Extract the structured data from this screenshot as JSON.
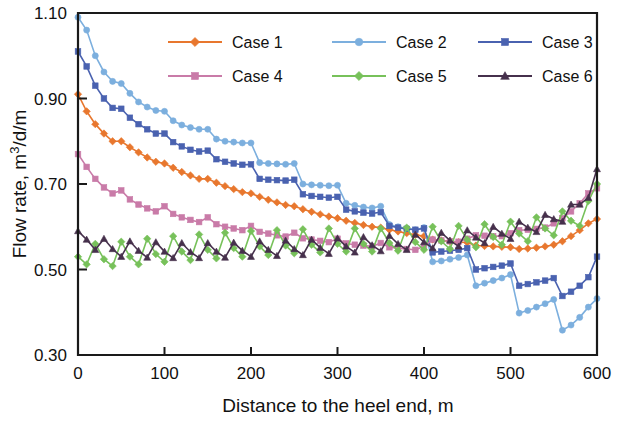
{
  "chart_data": {
    "type": "line",
    "title": "",
    "xlabel": "Distance to the heel end, m",
    "ylabel": "Flow rate, m³/d/m",
    "xlim": [
      0,
      600
    ],
    "ylim": [
      0.3,
      1.1
    ],
    "xticks": [
      0,
      100,
      200,
      300,
      400,
      500,
      600
    ],
    "yticks": [
      0.3,
      0.5,
      0.7,
      0.9,
      1.1
    ],
    "xtick_labels": [
      "0",
      "100",
      "200",
      "300",
      "400",
      "500",
      "600"
    ],
    "ytick_labels": [
      "0.30",
      "0.50",
      "0.70",
      "0.90",
      "1.10"
    ],
    "grid": false,
    "legend_position": "top-center-inside",
    "legend_columns": 3,
    "x": [
      0,
      10,
      20,
      30,
      40,
      50,
      60,
      70,
      80,
      90,
      100,
      110,
      120,
      130,
      140,
      150,
      160,
      170,
      180,
      190,
      200,
      210,
      220,
      230,
      240,
      250,
      260,
      270,
      280,
      290,
      300,
      310,
      320,
      330,
      340,
      350,
      360,
      370,
      380,
      390,
      400,
      410,
      420,
      430,
      440,
      450,
      460,
      470,
      480,
      490,
      500,
      510,
      520,
      530,
      540,
      550,
      560,
      570,
      580,
      590,
      600
    ],
    "series": [
      {
        "name": "Case 1",
        "color": "#E8772E",
        "marker": "diamond",
        "values": [
          0.91,
          0.87,
          0.84,
          0.818,
          0.8,
          0.8,
          0.786,
          0.774,
          0.762,
          0.752,
          0.748,
          0.738,
          0.728,
          0.72,
          0.712,
          0.712,
          0.703,
          0.695,
          0.688,
          0.681,
          0.678,
          0.67,
          0.663,
          0.657,
          0.651,
          0.648,
          0.641,
          0.635,
          0.629,
          0.624,
          0.62,
          0.614,
          0.609,
          0.604,
          0.6,
          0.598,
          0.593,
          0.589,
          0.585,
          0.581,
          0.578,
          0.57,
          0.568,
          0.566,
          0.564,
          0.563,
          0.556,
          0.555,
          0.554,
          0.553,
          0.552,
          0.548,
          0.549,
          0.551,
          0.554,
          0.558,
          0.566,
          0.578,
          0.592,
          0.608,
          0.618
        ]
      },
      {
        "name": "Case 2",
        "color": "#7CAFDE",
        "marker": "circle",
        "values": [
          1.09,
          1.06,
          1.0,
          0.962,
          0.94,
          0.935,
          0.912,
          0.892,
          0.88,
          0.872,
          0.87,
          0.848,
          0.838,
          0.832,
          0.828,
          0.828,
          0.805,
          0.8,
          0.798,
          0.796,
          0.796,
          0.75,
          0.748,
          0.747,
          0.746,
          0.748,
          0.7,
          0.698,
          0.697,
          0.696,
          0.697,
          0.655,
          0.65,
          0.646,
          0.644,
          0.648,
          0.605,
          0.6,
          0.596,
          0.593,
          0.598,
          0.518,
          0.52,
          0.524,
          0.528,
          0.534,
          0.462,
          0.468,
          0.474,
          0.48,
          0.488,
          0.398,
          0.404,
          0.412,
          0.42,
          0.43,
          0.358,
          0.37,
          0.388,
          0.412,
          0.432
        ]
      },
      {
        "name": "Case 3",
        "color": "#4A62B0",
        "marker": "square",
        "values": [
          1.01,
          0.975,
          0.93,
          0.9,
          0.878,
          0.876,
          0.855,
          0.84,
          0.828,
          0.818,
          0.818,
          0.798,
          0.788,
          0.78,
          0.776,
          0.778,
          0.758,
          0.752,
          0.748,
          0.745,
          0.746,
          0.712,
          0.71,
          0.709,
          0.708,
          0.71,
          0.676,
          0.672,
          0.67,
          0.668,
          0.67,
          0.64,
          0.636,
          0.633,
          0.631,
          0.634,
          0.602,
          0.598,
          0.595,
          0.593,
          0.596,
          0.54,
          0.542,
          0.544,
          0.546,
          0.55,
          0.5,
          0.503,
          0.506,
          0.509,
          0.514,
          0.462,
          0.466,
          0.47,
          0.474,
          0.48,
          0.438,
          0.448,
          0.462,
          0.482,
          0.53
        ]
      },
      {
        "name": "Case 4",
        "color": "#C97BA8",
        "marker": "square",
        "values": [
          0.77,
          0.74,
          0.712,
          0.692,
          0.678,
          0.685,
          0.664,
          0.652,
          0.643,
          0.636,
          0.648,
          0.63,
          0.622,
          0.616,
          0.611,
          0.622,
          0.606,
          0.6,
          0.596,
          0.592,
          0.602,
          0.588,
          0.584,
          0.58,
          0.577,
          0.586,
          0.573,
          0.57,
          0.567,
          0.564,
          0.572,
          0.561,
          0.558,
          0.556,
          0.554,
          0.562,
          0.552,
          0.55,
          0.548,
          0.546,
          0.554,
          0.57,
          0.568,
          0.566,
          0.565,
          0.572,
          0.58,
          0.579,
          0.578,
          0.578,
          0.585,
          0.592,
          0.593,
          0.595,
          0.598,
          0.608,
          0.62,
          0.636,
          0.655,
          0.678,
          0.69
        ]
      },
      {
        "name": "Case 5",
        "color": "#77C15A",
        "marker": "diamond",
        "values": [
          0.53,
          0.512,
          0.56,
          0.524,
          0.508,
          0.565,
          0.53,
          0.512,
          0.572,
          0.536,
          0.518,
          0.578,
          0.542,
          0.522,
          0.582,
          0.546,
          0.526,
          0.586,
          0.55,
          0.53,
          0.59,
          0.554,
          0.534,
          0.592,
          0.556,
          0.538,
          0.594,
          0.558,
          0.54,
          0.596,
          0.56,
          0.542,
          0.596,
          0.56,
          0.542,
          0.596,
          0.562,
          0.544,
          0.598,
          0.564,
          0.546,
          0.6,
          0.566,
          0.548,
          0.602,
          0.57,
          0.552,
          0.606,
          0.576,
          0.558,
          0.612,
          0.584,
          0.566,
          0.622,
          0.596,
          0.58,
          0.636,
          0.614,
          0.602,
          0.66,
          0.7
        ]
      },
      {
        "name": "Case 6",
        "color": "#46304C",
        "marker": "triangle",
        "values": [
          0.59,
          0.57,
          0.546,
          0.572,
          0.548,
          0.53,
          0.566,
          0.544,
          0.528,
          0.564,
          0.542,
          0.527,
          0.562,
          0.541,
          0.527,
          0.562,
          0.542,
          0.528,
          0.563,
          0.544,
          0.53,
          0.566,
          0.546,
          0.532,
          0.568,
          0.548,
          0.534,
          0.57,
          0.551,
          0.537,
          0.573,
          0.554,
          0.54,
          0.576,
          0.557,
          0.543,
          0.579,
          0.56,
          0.546,
          0.582,
          0.564,
          0.55,
          0.586,
          0.568,
          0.554,
          0.592,
          0.575,
          0.562,
          0.6,
          0.584,
          0.572,
          0.612,
          0.598,
          0.588,
          0.628,
          0.618,
          0.612,
          0.652,
          0.652,
          0.668,
          0.735
        ]
      }
    ]
  },
  "legend": {
    "entries": [
      {
        "label": "Case 1"
      },
      {
        "label": "Case 2"
      },
      {
        "label": "Case 3"
      },
      {
        "label": "Case 4"
      },
      {
        "label": "Case 5"
      },
      {
        "label": "Case 6"
      }
    ]
  }
}
